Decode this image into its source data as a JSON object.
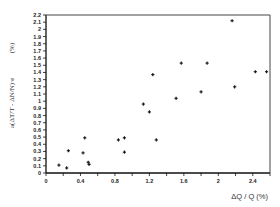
{
  "chart_data": {
    "type": "scatter",
    "title": "",
    "xlabel": "ΔQ / Q (%)",
    "ylabel": "a(ΔT/T - ΔN/N)·e",
    "ylabel_unit": "(%)",
    "xlim": [
      0,
      2.6
    ],
    "ylim": [
      0,
      2.2
    ],
    "x_ticks": [
      0,
      0.4,
      0.8,
      1.2,
      1.6,
      2,
      2.4
    ],
    "x_tick_labels": [
      "0",
      "0.4",
      "0.8",
      "1.2",
      "1.6",
      "2",
      "2.4"
    ],
    "x_minor_step": 0.2,
    "y_ticks": [
      0,
      0.1,
      0.2,
      0.3,
      0.4,
      0.5,
      0.6,
      0.7,
      0.8,
      0.9,
      1,
      1.1,
      1.2,
      1.3,
      1.4,
      1.5,
      1.6,
      1.7,
      1.8,
      1.9,
      2,
      2.1,
      2.2
    ],
    "y_tick_labels": [
      "0",
      "0.1",
      "0.2",
      "0.3",
      "0.4",
      "0.5",
      "0.6",
      "0.7",
      "0.8",
      "0.9",
      "1",
      "1.1",
      "1.2",
      "1.3",
      "1.4",
      "1.5",
      "1.6",
      "1.7",
      "1.8",
      "1.9",
      "2",
      "2.1",
      "2.2"
    ],
    "grid": false,
    "legend": null,
    "marker": "+",
    "series": [
      {
        "name": "data",
        "points": [
          {
            "x": 0.15,
            "y": 0.11
          },
          {
            "x": 0.24,
            "y": 0.07
          },
          {
            "x": 0.26,
            "y": 0.31
          },
          {
            "x": 0.43,
            "y": 0.28
          },
          {
            "x": 0.45,
            "y": 0.49
          },
          {
            "x": 0.49,
            "y": 0.15
          },
          {
            "x": 0.5,
            "y": 0.12
          },
          {
            "x": 0.84,
            "y": 0.46
          },
          {
            "x": 0.91,
            "y": 0.49
          },
          {
            "x": 0.91,
            "y": 0.29
          },
          {
            "x": 1.13,
            "y": 0.96
          },
          {
            "x": 1.2,
            "y": 0.85
          },
          {
            "x": 1.24,
            "y": 1.37
          },
          {
            "x": 1.28,
            "y": 0.46
          },
          {
            "x": 1.51,
            "y": 1.04
          },
          {
            "x": 1.57,
            "y": 1.53
          },
          {
            "x": 1.8,
            "y": 1.13
          },
          {
            "x": 1.87,
            "y": 1.53
          },
          {
            "x": 2.16,
            "y": 2.12
          },
          {
            "x": 2.19,
            "y": 1.2
          },
          {
            "x": 2.43,
            "y": 1.41
          },
          {
            "x": 2.56,
            "y": 1.41
          }
        ]
      }
    ]
  }
}
